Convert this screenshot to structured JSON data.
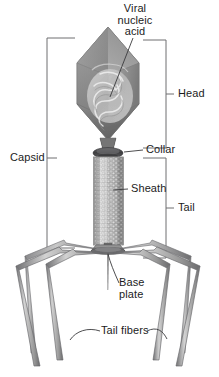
{
  "diagram": {
    "background_color": "#ffffff"
  },
  "labels": {
    "viral_nucleic_acid": "Viral\nnucleic\nacid",
    "head": "Head",
    "collar": "Collar",
    "sheath": "Sheath",
    "tail": "Tail",
    "capsid": "Capsid",
    "base_plate": "Base\nplate",
    "tail_fibers": "Tail fibers"
  },
  "parts": [
    {
      "id": "head",
      "name": "Head",
      "shape": "elongated-icosahedral-capsid"
    },
    {
      "id": "viral-nucleic-acid",
      "name": "Viral nucleic acid",
      "shape": "coiled-strand-inside-head"
    },
    {
      "id": "collar",
      "name": "Collar",
      "shape": "dark-ellipse-ring"
    },
    {
      "id": "sheath",
      "name": "Sheath",
      "shape": "beaded-helical-cylinder"
    },
    {
      "id": "base-plate",
      "name": "Base plate",
      "shape": "hexagonal-plate"
    },
    {
      "id": "tail-fibers",
      "name": "Tail fibers",
      "shape": "six-jointed-rods"
    },
    {
      "id": "tail-pin",
      "name": "Tail pin",
      "shape": "thin-spike"
    }
  ],
  "brackets": [
    {
      "id": "capsid-bracket",
      "label": "Capsid",
      "side": "left"
    },
    {
      "id": "head-bracket",
      "label": "Head",
      "side": "right"
    },
    {
      "id": "tail-bracket",
      "label": "Tail",
      "side": "right"
    }
  ],
  "colors": {
    "line": "#58585a",
    "bracket": "#6e6e70",
    "text": "#1c1c1c",
    "capsid_light": "#c9c9c9",
    "capsid_mid": "#9a9a9a",
    "capsid_dark": "#6f6f6f",
    "collar_dark": "#4a4a4c",
    "sheath_light": "#d8d8d8",
    "sheath_mid": "#a8a8a8",
    "fiber_light": "#cfcfcf",
    "fiber_dark": "#6a6a6c"
  }
}
